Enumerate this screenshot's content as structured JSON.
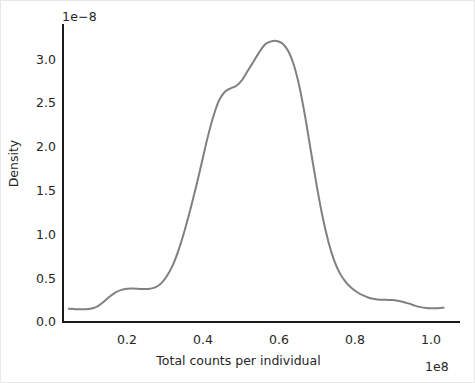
{
  "chart_data": {
    "type": "line",
    "title": "",
    "xlabel": "Total counts per individual",
    "ylabel": "Density",
    "x_offset_text": "1e8",
    "y_offset_text": "1e−8",
    "x_tick_labels": [
      "0.2",
      "0.4",
      "0.6",
      "0.8",
      "1.0"
    ],
    "x_tick_values": [
      0.2,
      0.4,
      0.6,
      0.8,
      1.0
    ],
    "y_tick_labels": [
      "0.0",
      "0.5",
      "1.0",
      "1.5",
      "2.0",
      "2.5",
      "3.0"
    ],
    "y_tick_values": [
      0.0,
      0.5,
      1.0,
      1.5,
      2.0,
      2.5,
      3.0
    ],
    "xlim": [
      0.043,
      1.075
    ],
    "ylim": [
      -0.09,
      3.42
    ],
    "grid": false,
    "legend": false,
    "line_color": "#808080",
    "line_width": 2.0,
    "series": [
      {
        "name": "density",
        "x": [
          0.058,
          0.075,
          0.09,
          0.105,
          0.12,
          0.135,
          0.15,
          0.165,
          0.18,
          0.195,
          0.21,
          0.225,
          0.24,
          0.255,
          0.27,
          0.285,
          0.3,
          0.315,
          0.33,
          0.345,
          0.36,
          0.375,
          0.39,
          0.405,
          0.42,
          0.435,
          0.45,
          0.465,
          0.48,
          0.495,
          0.51,
          0.525,
          0.54,
          0.555,
          0.57,
          0.585,
          0.6,
          0.615,
          0.63,
          0.645,
          0.66,
          0.675,
          0.69,
          0.705,
          0.72,
          0.735,
          0.75,
          0.765,
          0.78,
          0.795,
          0.81,
          0.825,
          0.84,
          0.855,
          0.87,
          0.885,
          0.9,
          0.915,
          0.93,
          0.945,
          0.96,
          0.975,
          0.99,
          1.005,
          1.02,
          1.035
        ],
        "y": [
          0.055,
          0.05,
          0.048,
          0.05,
          0.06,
          0.09,
          0.14,
          0.2,
          0.248,
          0.278,
          0.292,
          0.294,
          0.29,
          0.288,
          0.292,
          0.31,
          0.36,
          0.45,
          0.58,
          0.76,
          0.98,
          1.23,
          1.5,
          1.79,
          2.08,
          2.33,
          2.52,
          2.62,
          2.66,
          2.69,
          2.76,
          2.87,
          2.98,
          3.09,
          3.18,
          3.215,
          3.22,
          3.19,
          3.1,
          2.93,
          2.66,
          2.3,
          1.89,
          1.49,
          1.13,
          0.84,
          0.62,
          0.47,
          0.37,
          0.3,
          0.25,
          0.212,
          0.185,
          0.17,
          0.162,
          0.16,
          0.158,
          0.15,
          0.135,
          0.115,
          0.092,
          0.074,
          0.064,
          0.06,
          0.062,
          0.068
        ],
        "peak_x": 0.6,
        "peak_y": 3.22,
        "shoulder_x": 0.48,
        "shoulder_y": 2.66,
        "left_bump_x": 0.225,
        "left_bump_y": 0.294,
        "right_bump_x": 0.885,
        "right_bump_y": 0.16
      }
    ]
  },
  "figure": {
    "background_color": "#ffffff",
    "axes_text_color": "#262626",
    "spine_color": "#1a1a1a"
  }
}
